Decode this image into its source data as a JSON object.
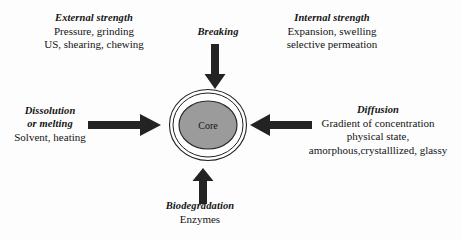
{
  "diagram": {
    "title_absent": true,
    "center": {
      "core_label": "Core",
      "core_fill_color": "#9b9b9b",
      "core_stroke_color": "#2a2a2a",
      "outer_ring_fill": "#ffffff",
      "outer_ring_stroke": "#222222"
    },
    "arrow_color": "#232323",
    "factors": [
      {
        "id": "external-strength",
        "heading": "External strength",
        "lines": [
          "Pressure, grinding",
          "US, shearing, chewing"
        ],
        "position": "top-left",
        "has_arrow": false
      },
      {
        "id": "breaking",
        "heading": "Breaking",
        "lines": [],
        "position": "top-center",
        "has_arrow": true,
        "arrow_direction": "down"
      },
      {
        "id": "internal-strength",
        "heading": "Internal strength",
        "lines": [
          "Expansion, swelling",
          "selective permeation"
        ],
        "position": "top-right",
        "has_arrow": false
      },
      {
        "id": "dissolution-or-melting",
        "heading_line1": "Dissolution",
        "heading_line2": "or melting",
        "lines": [
          "Solvent, heating"
        ],
        "position": "left",
        "has_arrow": true,
        "arrow_direction": "right"
      },
      {
        "id": "diffusion",
        "heading": "Diffusion",
        "lines": [
          "Gradient of concentration",
          "physical state,",
          "amorphous,crystalllized, glassy"
        ],
        "position": "right",
        "has_arrow": true,
        "arrow_direction": "left"
      },
      {
        "id": "biodegradation",
        "heading": "Biodegradation",
        "lines": [
          "Enzymes"
        ],
        "position": "bottom-center",
        "has_arrow": true,
        "arrow_direction": "up"
      }
    ]
  }
}
